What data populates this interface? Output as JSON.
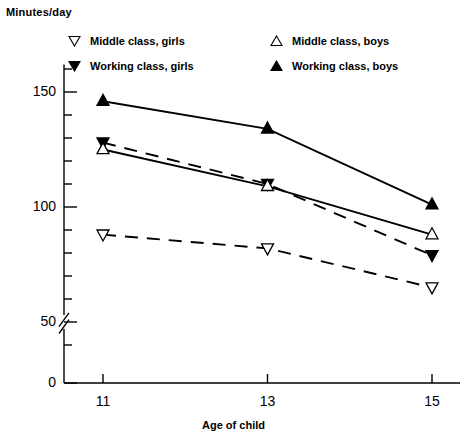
{
  "axes": {
    "y_title": "Minutes/day",
    "x_title": "Age of child",
    "y_ticks": [
      {
        "value": 150,
        "label": "150"
      },
      {
        "value": 100,
        "label": "100"
      },
      {
        "value": 50,
        "label": "50"
      },
      {
        "value": 0,
        "label": "0"
      }
    ],
    "x_ticks": [
      {
        "value": 11,
        "label": "11"
      },
      {
        "value": 13,
        "label": "13"
      },
      {
        "value": 15,
        "label": "15"
      }
    ],
    "axis_break": true
  },
  "legend": {
    "entries": [
      {
        "label": "Middle class, girls",
        "marker": "open-down-triangle-icon",
        "line": "dashed"
      },
      {
        "label": "Working class, girls",
        "marker": "filled-down-triangle-icon",
        "line": "dashed"
      },
      {
        "label": "Middle class, boys",
        "marker": "open-up-triangle-icon",
        "line": "solid"
      },
      {
        "label": "Working class, boys",
        "marker": "filled-up-triangle-icon",
        "line": "solid"
      }
    ]
  },
  "chart_data": {
    "type": "line",
    "title": "",
    "xlabel": "Age of child",
    "ylabel": "Minutes/day",
    "x": [
      11,
      13,
      15
    ],
    "xlim": [
      10.3,
      15.7
    ],
    "ylim": [
      0,
      165
    ],
    "ytick_values": [
      150,
      100,
      50,
      0
    ],
    "yminor_step": 10,
    "grid": false,
    "axis_break_between": [
      0,
      50
    ],
    "legend_position": "top-inside",
    "series": [
      {
        "name": "Middle class, girls",
        "values": [
          88,
          82,
          65
        ],
        "marker": "open-down-triangle",
        "linestyle": "dashed",
        "color": "#000000"
      },
      {
        "name": "Working class, girls",
        "values": [
          128,
          110,
          79
        ],
        "marker": "filled-down-triangle",
        "linestyle": "dashed",
        "color": "#000000"
      },
      {
        "name": "Middle class, boys",
        "values": [
          125,
          109,
          88
        ],
        "marker": "open-up-triangle",
        "linestyle": "solid",
        "color": "#000000"
      },
      {
        "name": "Working class, boys",
        "values": [
          146,
          134,
          101
        ],
        "marker": "filled-up-triangle",
        "linestyle": "solid",
        "color": "#000000"
      }
    ]
  }
}
